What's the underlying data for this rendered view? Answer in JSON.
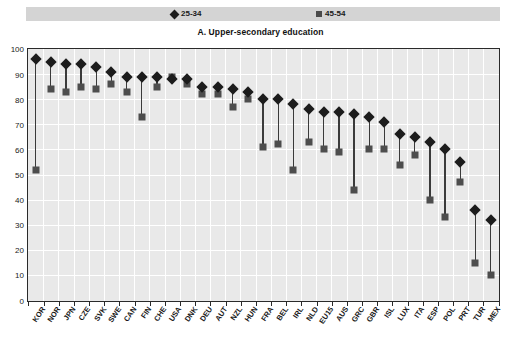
{
  "legend": {
    "entries": [
      {
        "label": "25-34",
        "marker": "diamond-icon",
        "color": "#1c1c1c"
      },
      {
        "label": "45-54",
        "marker": "square-icon",
        "color": "#4d4d4d"
      }
    ]
  },
  "chart_data": {
    "type": "scatter",
    "title": "A. Upper-secondary education",
    "xlabel": "",
    "ylabel": "",
    "ylim": [
      0,
      100
    ],
    "yticks": [
      0,
      10,
      20,
      30,
      40,
      50,
      60,
      70,
      80,
      90,
      100
    ],
    "grid": true,
    "legend_position": "top",
    "categories": [
      "KOR",
      "NOR",
      "JPN",
      "CZE",
      "SVK",
      "SWE",
      "CAN",
      "FIN",
      "CHE",
      "USA",
      "DNK",
      "DEU",
      "AUT",
      "NZL",
      "HUN",
      "FRA",
      "BEL",
      "IRL",
      "NLD",
      "EU15",
      "AUS",
      "GRC",
      "GBR",
      "ISL",
      "LUX",
      "ITA",
      "ESP",
      "POL",
      "PRT",
      "TUR",
      "MEX"
    ],
    "series": [
      {
        "name": "25-34",
        "marker": "diamond",
        "color": "#1c1c1c",
        "values": [
          96,
          95,
          94,
          94,
          93,
          91,
          89,
          89,
          89,
          88,
          88,
          85,
          85,
          84,
          83,
          80,
          80,
          78,
          76,
          75,
          75,
          74,
          73,
          71,
          66,
          65,
          63,
          60,
          55,
          36,
          32
        ]
      },
      {
        "name": "45-54",
        "marker": "square",
        "color": "#4d4d4d",
        "values": [
          52,
          84,
          83,
          85,
          84,
          86,
          83,
          73,
          85,
          89,
          86,
          82,
          82,
          77,
          80,
          61,
          62,
          52,
          63,
          60,
          59,
          44,
          60,
          60,
          54,
          58,
          40,
          33,
          47,
          15,
          10
        ]
      }
    ]
  }
}
